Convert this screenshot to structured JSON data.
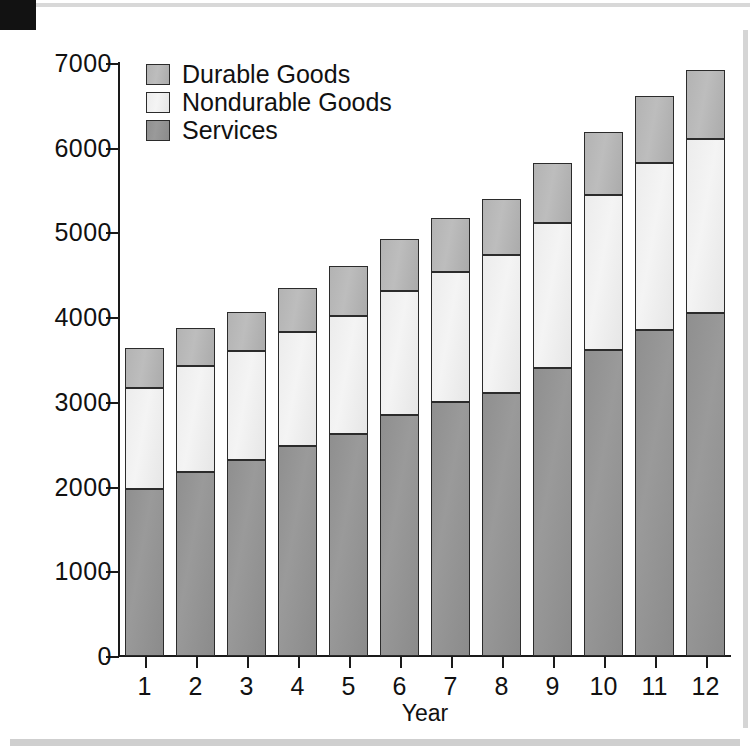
{
  "chart_data": {
    "type": "bar",
    "subtype": "stacked-bar",
    "title": "",
    "xlabel": "Year",
    "ylabel": "Billions of Dollars",
    "categories": [
      "1",
      "2",
      "3",
      "4",
      "5",
      "6",
      "7",
      "8",
      "9",
      "10",
      "11",
      "12"
    ],
    "ylim": [
      0,
      7000
    ],
    "yticks": [
      0,
      1000,
      2000,
      3000,
      4000,
      5000,
      6000,
      7000
    ],
    "ytick_labels": [
      "0",
      "1000",
      "2000",
      "3000",
      "4000",
      "5000",
      "6000",
      "7000"
    ],
    "grid": false,
    "legend_position": "top-left",
    "stack_order_bottom_to_top": [
      "Services",
      "Nondurable Goods",
      "Durable Goods"
    ],
    "series": [
      {
        "name": "Services",
        "color": "#939393",
        "values": [
          1970,
          2170,
          2310,
          2480,
          2620,
          2840,
          3000,
          3110,
          3400,
          3610,
          3850,
          4050
        ]
      },
      {
        "name": "Nondurable Goods",
        "color": "#efefef",
        "values": [
          1190,
          1250,
          1290,
          1340,
          1390,
          1470,
          1530,
          1620,
          1710,
          1830,
          1970,
          2050
        ]
      },
      {
        "name": "Durable Goods",
        "color": "#b8b8b8",
        "values": [
          480,
          450,
          460,
          530,
          590,
          610,
          640,
          670,
          710,
          750,
          790,
          820
        ]
      }
    ],
    "totals": [
      3640,
      3870,
      4060,
      4350,
      4600,
      4920,
      5170,
      5400,
      5820,
      6190,
      6610,
      6920
    ]
  },
  "legend": {
    "items": [
      {
        "label": "Durable Goods",
        "swatch": "durable-goods-swatch"
      },
      {
        "label": "Nondurable Goods",
        "swatch": "nondurable-goods-swatch"
      },
      {
        "label": "Services",
        "swatch": "services-swatch"
      }
    ]
  },
  "axes": {
    "y_axis_title": "Billions of Dollars",
    "x_axis_title": "Year"
  },
  "colors": {
    "services": "#939393",
    "nondurable": "#efefef",
    "durable": "#b8b8b8",
    "outline": "#2b2b2b",
    "text": "#111111"
  }
}
